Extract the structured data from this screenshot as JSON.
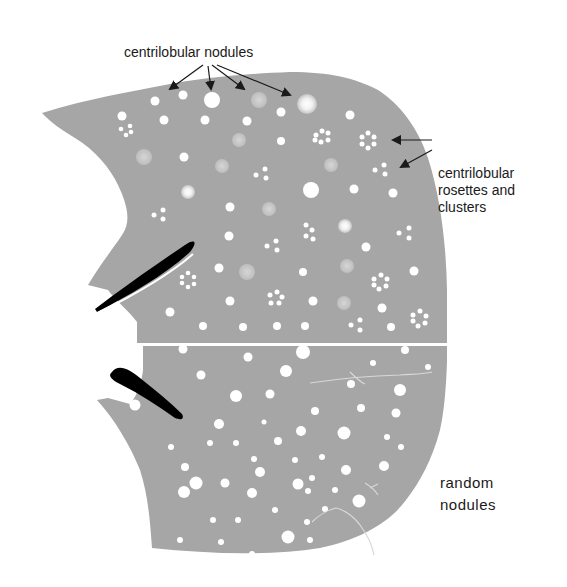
{
  "figure": {
    "colors": {
      "parenchyma": "#a6a6a6",
      "nodule": "#ffffff",
      "ground_glass_nodule": "#c8c8c8",
      "vessel": "#000000",
      "arrow": "#1a1a1a",
      "background": "#ffffff"
    }
  },
  "labels": {
    "centrilobular_nodules": "centrilobular nodules",
    "centrilobular_rosettes": {
      "line1": "centrilobular",
      "line2": "rosettes and",
      "line3": "clusters"
    },
    "random_nodules": {
      "line1": "random",
      "line2": "nodules"
    }
  },
  "regions": [
    {
      "name": "upper-lobe",
      "pattern": "centrilobular nodules, rosettes and clusters"
    },
    {
      "name": "lower-lobe",
      "pattern": "random nodules"
    }
  ]
}
